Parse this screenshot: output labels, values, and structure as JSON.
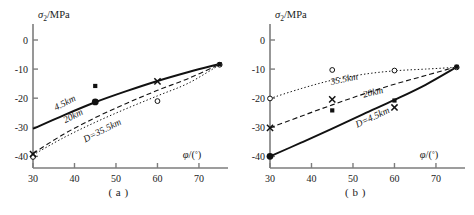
{
  "figure": {
    "panels": [
      {
        "caption": "( a )",
        "ylabel": "σ₂/MPa",
        "xlabel": "φ/(°)",
        "yticks": [
          "0",
          "-10",
          "-20",
          "-30",
          "-40"
        ],
        "xticks": [
          "30",
          "40",
          "50",
          "60",
          "70"
        ],
        "curve_labels": [
          {
            "text": "D=35.5km",
            "x": 47,
            "y": -32.0,
            "rotate": -27
          },
          {
            "text": "20km",
            "x": 40,
            "y": -27.0,
            "rotate": -27
          },
          {
            "text": "4.5km",
            "x": 38,
            "y": -22.5,
            "rotate": -27
          }
        ]
      },
      {
        "caption": "( b )",
        "ylabel": "σ₂/MPa",
        "xlabel": "φ/(°)",
        "yticks": [
          "0",
          "-10",
          "-20",
          "-30",
          "-40"
        ],
        "xticks": [
          "30",
          "40",
          "50",
          "60",
          "70"
        ],
        "curve_labels": [
          {
            "text": "D=4.5km",
            "x": 55,
            "y": -27.5,
            "rotate": -25
          },
          {
            "text": "20km",
            "x": 55,
            "y": -19.0,
            "rotate": -14
          },
          {
            "text": "35.5km",
            "x": 48,
            "y": -14.5,
            "rotate": -12
          }
        ]
      }
    ]
  },
  "chart_data": [
    {
      "type": "line",
      "title": "( a )",
      "xlabel": "φ/(°)",
      "ylabel": "σ₂/MPa",
      "xlim": [
        30,
        77
      ],
      "ylim": [
        -44,
        0
      ],
      "xticks": [
        30,
        40,
        50,
        60,
        70
      ],
      "yticks": [
        0,
        -10,
        -20,
        -30,
        -40
      ],
      "grid": false,
      "legend": "inline-curve-labels",
      "series": [
        {
          "name": "D=35.5km",
          "style": "dotted",
          "x": [
            30,
            37.5,
            45,
            52.5,
            60,
            67.5,
            75
          ],
          "values": [
            -39.5,
            -33.5,
            -28.3,
            -23.6,
            -19.2,
            -14.8,
            -8.5
          ]
        },
        {
          "name": "20km",
          "style": "dashed",
          "x": [
            30,
            37.5,
            45,
            52.5,
            60,
            67.5,
            75
          ],
          "values": [
            -39.0,
            -32.3,
            -26.7,
            -21.8,
            -17.3,
            -13.2,
            -8.3
          ]
        },
        {
          "name": "4.5km",
          "style": "solid",
          "x": [
            30,
            37.5,
            45,
            52.5,
            60,
            67.5,
            75
          ],
          "values": [
            -30.5,
            -25.8,
            -21.4,
            -17.6,
            -14.1,
            -11.0,
            -8.2
          ]
        }
      ],
      "points": [
        {
          "marker": "open-circle",
          "x": 30,
          "y": -40.2
        },
        {
          "marker": "cross",
          "x": 30,
          "y": -39.2
        },
        {
          "marker": "filled-circle",
          "x": 45,
          "y": -21.3
        },
        {
          "marker": "filled-square",
          "x": 45,
          "y": -15.8
        },
        {
          "marker": "open-circle",
          "x": 60,
          "y": -21.0
        },
        {
          "marker": "cross",
          "x": 60,
          "y": -14.2
        },
        {
          "marker": "open-circle",
          "x": 75,
          "y": -8.5
        },
        {
          "marker": "filled-square",
          "x": 75,
          "y": -8.3
        }
      ]
    },
    {
      "type": "line",
      "title": "( b )",
      "xlabel": "φ/(°)",
      "ylabel": "σ₂/MPa",
      "xlim": [
        30,
        77
      ],
      "ylim": [
        -44,
        0
      ],
      "xticks": [
        30,
        40,
        50,
        60,
        70
      ],
      "yticks": [
        0,
        -10,
        -20,
        -30,
        -40
      ],
      "grid": false,
      "legend": "inline-curve-labels",
      "series": [
        {
          "name": "D=4.5km",
          "style": "solid",
          "x": [
            30,
            37.5,
            45,
            52.5,
            60,
            67.5,
            75
          ],
          "values": [
            -40.0,
            -35.3,
            -30.5,
            -25.5,
            -20.6,
            -15.4,
            -9.3
          ]
        },
        {
          "name": "20km",
          "style": "dashed",
          "x": [
            30,
            37.5,
            45,
            52.5,
            60,
            67.5,
            75
          ],
          "values": [
            -30.2,
            -26.2,
            -22.3,
            -18.6,
            -15.2,
            -12.2,
            -9.2
          ]
        },
        {
          "name": "35.5km",
          "style": "dotted",
          "x": [
            30,
            37.5,
            45,
            52.5,
            60,
            67.5,
            75
          ],
          "values": [
            -20.1,
            -16.7,
            -13.8,
            -11.8,
            -10.6,
            -10.0,
            -9.4
          ]
        }
      ],
      "points": [
        {
          "marker": "filled-circle",
          "x": 30,
          "y": -40.0
        },
        {
          "marker": "cross",
          "x": 30,
          "y": -30.2
        },
        {
          "marker": "open-circle",
          "x": 30,
          "y": -20.1
        },
        {
          "marker": "filled-square",
          "x": 45,
          "y": -24.2
        },
        {
          "marker": "cross",
          "x": 45,
          "y": -20.4
        },
        {
          "marker": "open-circle",
          "x": 45,
          "y": -10.3
        },
        {
          "marker": "cross",
          "x": 60,
          "y": -23.2
        },
        {
          "marker": "filled-square",
          "x": 60,
          "y": -20.8
        },
        {
          "marker": "open-circle",
          "x": 60,
          "y": -10.5
        },
        {
          "marker": "open-circle",
          "x": 75,
          "y": -9.4
        },
        {
          "marker": "filled-square",
          "x": 75,
          "y": -9.2
        }
      ]
    }
  ],
  "colors": {
    "axis": "#7d7d7d",
    "curve": "#111111",
    "text": "#1a1a1a"
  }
}
